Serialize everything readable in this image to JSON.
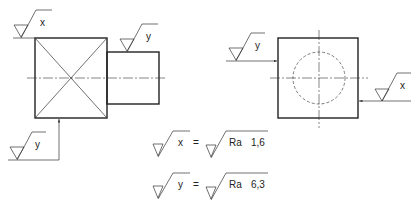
{
  "drawing": {
    "front_view": {
      "symbol_top": "x",
      "symbol_shaft": "y",
      "symbol_bottom": "y"
    },
    "side_view": {
      "symbol_left": "y",
      "symbol_right": "x"
    },
    "legend": [
      {
        "symbol": "x",
        "equals": "=",
        "param": "Ra",
        "value": "1,6"
      },
      {
        "symbol": "y",
        "equals": "=",
        "param": "Ra",
        "value": "6,3"
      }
    ]
  }
}
